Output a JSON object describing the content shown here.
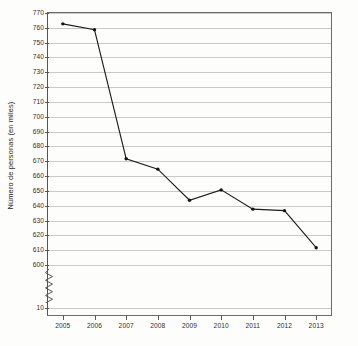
{
  "chart_data": {
    "type": "line",
    "title": "",
    "xlabel": "",
    "ylabel": "Número de personas (en miles)",
    "categories": [
      "2005",
      "2006",
      "2007",
      "2008",
      "2009",
      "2010",
      "2011",
      "2012",
      "2013"
    ],
    "values": [
      762,
      758,
      671,
      664,
      643,
      650,
      637,
      636,
      611
    ],
    "series": [
      {
        "name": "Número de personas (en miles)",
        "values": [
          762,
          758,
          671,
          664,
          643,
          650,
          637,
          636,
          611
        ]
      }
    ],
    "x_tick_labels": [
      "2005",
      "2006",
      "2007",
      "2008",
      "2009",
      "2010",
      "2011",
      "2012",
      "2013"
    ],
    "y_tick_labels": [
      "770",
      "760",
      "750",
      "740",
      "730",
      "720",
      "710",
      "700",
      "690",
      "680",
      "670",
      "660",
      "650",
      "640",
      "630",
      "620",
      "610",
      "600",
      "10"
    ],
    "y_tick_values": [
      770,
      760,
      750,
      740,
      730,
      720,
      710,
      700,
      690,
      680,
      670,
      660,
      650,
      640,
      630,
      620,
      610,
      600,
      10
    ],
    "ylim": [
      10,
      770
    ],
    "axis_break": true,
    "axis_break_between": [
      600,
      10
    ],
    "grid": "horizontal",
    "legend": "none",
    "line_color": "#1d1d1d",
    "marker": "dot",
    "background_color": "#fdfdfc",
    "gridline_color": "#c9c9c9"
  }
}
